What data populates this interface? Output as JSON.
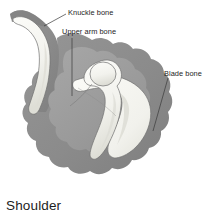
{
  "figure": {
    "caption": "Shoulder",
    "style": "grayscale-line-illustration",
    "background_color": "#ffffff"
  },
  "palette": {
    "background": "#ffffff",
    "outer_body_gray": "#8b8b8b",
    "outer_body_gray_shadow": "#7b7b7b",
    "inner_mid_gray": "#9c9c9c",
    "inner_mid_gray_light": "#a8a8a8",
    "bone_light": "#f3f3ee",
    "bone_light_shade": "#e3e3dc",
    "bone_outline": "#6f6f6f",
    "leader_line": "#3a3a3a",
    "label_text": "#232323",
    "caption_text": "#1d1d1d"
  },
  "labels": [
    {
      "id": "knuckle-bone",
      "text": "Knuckle bone",
      "text_x": 68,
      "text_y": 8,
      "leader": {
        "x1": 66,
        "y1": 14,
        "x2": 44,
        "y2": 26
      }
    },
    {
      "id": "upper-arm-bone",
      "text": "Upper arm bone",
      "text_x": 62,
      "text_y": 27,
      "leader": {
        "x1": 72,
        "y1": 38,
        "x2": 72,
        "y2": 96
      }
    },
    {
      "id": "blade-bone",
      "text": "Blade bone",
      "text_x": 164,
      "text_y": 69,
      "leader": {
        "x1": 168,
        "y1": 78,
        "x2": 153,
        "y2": 131
      }
    }
  ],
  "structures": [
    {
      "id": "clavicle",
      "common_name": "Knuckle bone",
      "anatomical_name": "collarbone",
      "fill": "#f3f3ee",
      "region": "upper-left"
    },
    {
      "id": "humerus",
      "common_name": "Upper arm bone",
      "anatomical_name": "humerus",
      "fill": "#f3f3ee",
      "region": "center"
    },
    {
      "id": "scapula",
      "common_name": "Blade bone",
      "anatomical_name": "shoulder blade",
      "fill": "#f3f3ee",
      "region": "right"
    },
    {
      "id": "soft-tissue-outer",
      "common_name": "surrounding tissue",
      "fill": "#8b8b8b",
      "region": "silhouette"
    },
    {
      "id": "soft-tissue-inner",
      "common_name": "deep tissue",
      "fill": "#9c9c9c",
      "region": "interior"
    }
  ]
}
